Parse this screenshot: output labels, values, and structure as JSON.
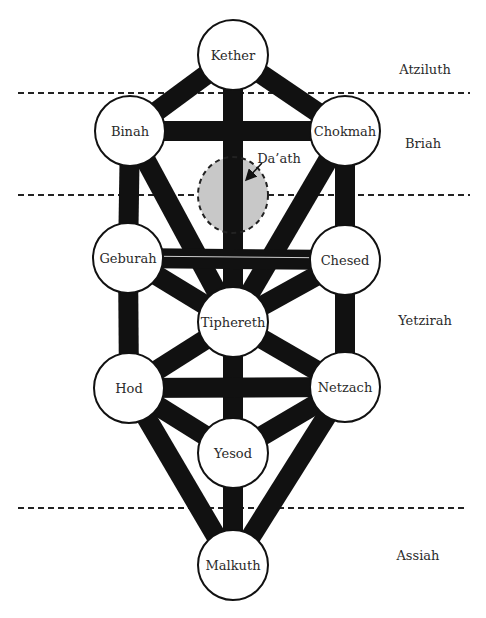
{
  "diagram": {
    "colors": {
      "path": "#111111",
      "node_fill": "#ffffff",
      "node_stroke": "#111111",
      "daath_fill": "#c8c8c8",
      "divider": "#222222",
      "text": "#2a2a2a"
    },
    "sephiroth": [
      {
        "id": "kether",
        "label": "Kether",
        "x": 233,
        "y": 55
      },
      {
        "id": "binah",
        "label": "Binah",
        "x": 130,
        "y": 131
      },
      {
        "id": "chokmah",
        "label": "Chokmah",
        "x": 345,
        "y": 131
      },
      {
        "id": "geburah",
        "label": "Geburah",
        "x": 128,
        "y": 258
      },
      {
        "id": "chesed",
        "label": "Chesed",
        "x": 345,
        "y": 260
      },
      {
        "id": "tiphereth",
        "label": "Tiphereth",
        "x": 233,
        "y": 322
      },
      {
        "id": "hod",
        "label": "Hod",
        "x": 129,
        "y": 388
      },
      {
        "id": "netzach",
        "label": "Netzach",
        "x": 345,
        "y": 387
      },
      {
        "id": "yesod",
        "label": "Yesod",
        "x": 233,
        "y": 453
      },
      {
        "id": "malkuth",
        "label": "Malkuth",
        "x": 233,
        "y": 565
      }
    ],
    "node_radius": 35,
    "path_width": 20,
    "paths": [
      [
        "kether",
        "binah"
      ],
      [
        "kether",
        "chokmah"
      ],
      [
        "kether",
        "tiphereth"
      ],
      [
        "binah",
        "chokmah"
      ],
      [
        "binah",
        "geburah"
      ],
      [
        "binah",
        "tiphereth"
      ],
      [
        "chokmah",
        "chesed"
      ],
      [
        "chokmah",
        "tiphereth"
      ],
      [
        "geburah",
        "chesed"
      ],
      [
        "geburah",
        "tiphereth"
      ],
      [
        "chesed",
        "tiphereth"
      ],
      [
        "geburah",
        "hod"
      ],
      [
        "chesed",
        "netzach"
      ],
      [
        "tiphereth",
        "hod"
      ],
      [
        "tiphereth",
        "netzach"
      ],
      [
        "tiphereth",
        "yesod"
      ],
      [
        "hod",
        "netzach"
      ],
      [
        "hod",
        "yesod"
      ],
      [
        "netzach",
        "yesod"
      ],
      [
        "hod",
        "malkuth"
      ],
      [
        "netzach",
        "malkuth"
      ],
      [
        "yesod",
        "malkuth"
      ]
    ],
    "daath": {
      "label": "Da’ath",
      "x": 233,
      "y": 195,
      "rx": 35,
      "ry": 38,
      "label_x": 279,
      "label_y": 158,
      "arrow_from": [
        262,
        163
      ],
      "arrow_to": [
        247,
        179
      ]
    },
    "worlds": [
      {
        "label": "Atziluth",
        "x": 425,
        "y": 69
      },
      {
        "label": "Briah",
        "x": 423,
        "y": 143
      },
      {
        "label": "Yetzirah",
        "x": 425,
        "y": 320
      },
      {
        "label": "Assiah",
        "x": 418,
        "y": 555
      }
    ],
    "dividers": [
      {
        "y": 93,
        "x1": 18,
        "x2": 470
      },
      {
        "y": 195,
        "x1": 18,
        "x2": 470
      },
      {
        "y": 508,
        "x1": 18,
        "x2": 467
      }
    ]
  }
}
